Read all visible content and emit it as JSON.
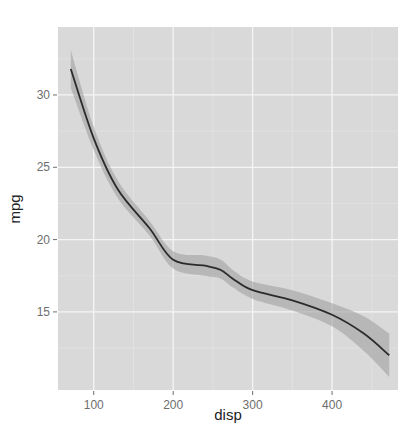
{
  "chart_data": {
    "type": "line",
    "title": "",
    "xlabel": "disp",
    "ylabel": "mpg",
    "xlim": [
      55,
      483
    ],
    "ylim": [
      9.6,
      34.7
    ],
    "x_ticks": [
      100,
      200,
      300,
      400
    ],
    "y_ticks": [
      15,
      20,
      25,
      30
    ],
    "x_tick_labels": [
      "100",
      "200",
      "300",
      "400"
    ],
    "y_tick_labels": [
      "15",
      "20",
      "25",
      "30"
    ],
    "grid": true,
    "legend": null,
    "series": [
      {
        "name": "smooth (loess fit)",
        "x": [
          71.1,
          100,
          130,
          170,
          200,
          240,
          260,
          275,
          300,
          350,
          400,
          440,
          472
        ],
        "y": [
          31.8,
          27.0,
          23.5,
          20.8,
          18.6,
          18.2,
          17.9,
          17.3,
          16.5,
          15.8,
          14.8,
          13.5,
          12.0
        ],
        "lower": [
          30.5,
          26.2,
          22.9,
          20.3,
          18.0,
          17.5,
          17.3,
          16.7,
          15.9,
          15.1,
          14.0,
          12.3,
          10.5
        ],
        "upper": [
          33.1,
          27.8,
          24.1,
          21.3,
          19.2,
          18.9,
          18.6,
          17.9,
          17.1,
          16.5,
          15.6,
          14.7,
          13.5
        ]
      }
    ],
    "colors": {
      "panel_bg": "#d9d9d9",
      "grid_major": "#f5f5f5",
      "grid_minor": "#e6e6e6",
      "line": "#2b2b2b",
      "ribbon": "#9a9a9a"
    }
  }
}
